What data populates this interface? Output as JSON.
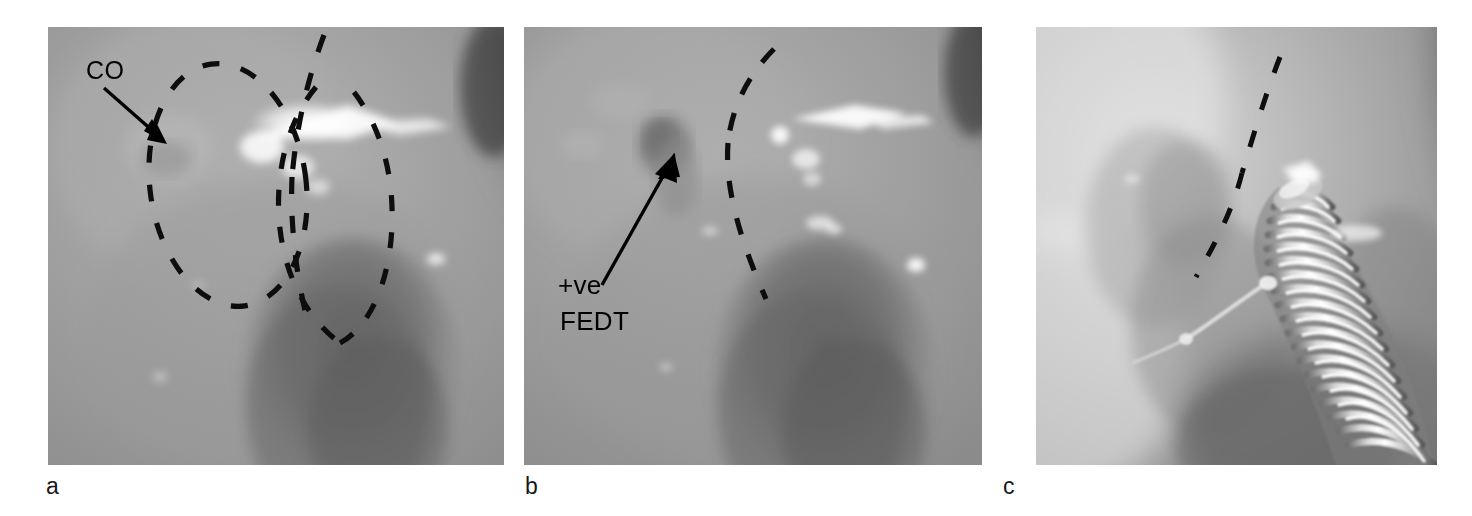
{
  "figure": {
    "kind": "endoscopic-photograph-triptych",
    "modality": "grayscale endoscopic / intraoperative photographs",
    "panel_count": 3,
    "background_color": "#ffffff",
    "ink_color": "#000000"
  },
  "panels": [
    {
      "id": "a",
      "label": "a",
      "label_x": 46,
      "label_y": 476,
      "x": 48,
      "y": 27,
      "width": 456,
      "height": 438,
      "base_color": "#9e9e9e",
      "description": "Endoscopic view of nasal / sinus mucosa with dashed outlines marking the olfactory cleft region and an arrow labelled CO pointing to the coronary / cribriform ostium",
      "annotations": [
        {
          "type": "text",
          "name": "co-label",
          "text": "CO",
          "x": 86,
          "y": 56,
          "font_size": 25
        },
        {
          "type": "arrow",
          "name": "co-arrow",
          "from_x": 104,
          "from_y": 88,
          "to_x": 163,
          "to_y": 140,
          "stroke_width": 3.2,
          "head_length": 22,
          "head_width": 15
        },
        {
          "type": "dashed-ellipse",
          "name": "lesion-outline-circle",
          "cx": 228,
          "cy": 185,
          "rx": 78,
          "ry": 122,
          "rotation": -8
        },
        {
          "type": "dashed-ellipse",
          "name": "lesion-outline-right",
          "cx": 316,
          "cy": 190,
          "rx": 62,
          "ry": 118,
          "rotation": 5
        },
        {
          "type": "dashed-curve",
          "name": "septal-line",
          "path": "M 322 32 C 300 80, 286 126, 282 170"
        }
      ],
      "highlights": [
        {
          "name": "specular-streak-main",
          "cx": 308,
          "cy": 122,
          "rx": 58,
          "ry": 19
        },
        {
          "name": "specular-streak-tail",
          "cx": 382,
          "cy": 124,
          "rx": 42,
          "ry": 8
        },
        {
          "name": "specular-dot-lower",
          "cx": 437,
          "cy": 262,
          "rx": 9,
          "ry": 5
        },
        {
          "name": "specular-dot-small",
          "cx": 160,
          "cy": 378,
          "rx": 7,
          "ry": 4
        }
      ],
      "shadows": [
        {
          "name": "turbinate-mass",
          "cx": 352,
          "cy": 372,
          "rx": 108,
          "ry": 135
        },
        {
          "name": "right-edge-shade",
          "cx": 500,
          "cy": 120,
          "rx": 48,
          "ry": 120
        }
      ]
    },
    {
      "id": "b",
      "label": "b",
      "label_x": 525,
      "label_y": 476,
      "x": 524,
      "y": 27,
      "width": 458,
      "height": 438,
      "base_color": "#9c9c9c",
      "description": "Same endoscopic field after fluorescein endoscopic dye test; arrow labelled +ve FEDT points to the positive dye-staining focus, with a single dashed line marking the boundary",
      "annotations": [
        {
          "type": "text",
          "name": "fedt-label-line1",
          "text": "+ve",
          "x": 558,
          "y": 272,
          "font_size": 26
        },
        {
          "type": "text",
          "name": "fedt-label-line2",
          "text": "FEDT",
          "x": 560,
          "y": 308,
          "font_size": 26
        },
        {
          "type": "arrow",
          "name": "fedt-arrow",
          "from_x": 608,
          "from_y": 281,
          "to_x": 672,
          "to_y": 160,
          "stroke_width": 3.2,
          "head_length": 24,
          "head_width": 16
        },
        {
          "type": "dashed-curve",
          "name": "boundary-line",
          "path": "M 756 47 C 724 78, 706 116, 704 156 C 702 212, 736 268, 754 300"
        }
      ],
      "highlights": [
        {
          "name": "specular-streak-main",
          "cx": 790,
          "cy": 110,
          "rx": 54,
          "ry": 10
        },
        {
          "name": "specular-dot-round",
          "cx": 760,
          "cy": 122,
          "rx": 8,
          "ry": 8
        },
        {
          "name": "specular-cluster",
          "cx": 780,
          "cy": 160,
          "rx": 16,
          "ry": 12
        },
        {
          "name": "specular-dot-right",
          "cx": 901,
          "cy": 262,
          "rx": 8,
          "ry": 6
        },
        {
          "name": "specular-dot-mid",
          "cx": 787,
          "cy": 212,
          "rx": 12,
          "ry": 7
        }
      ],
      "shadows": [
        {
          "name": "polyp-focus",
          "cx": 661,
          "cy": 140,
          "rx": 26,
          "ry": 28
        },
        {
          "name": "turbinate-mass",
          "cx": 830,
          "cy": 372,
          "rx": 108,
          "ry": 135
        },
        {
          "name": "right-edge-shade",
          "cx": 978,
          "cy": 110,
          "rx": 44,
          "ry": 110
        }
      ]
    },
    {
      "id": "c",
      "label": "c",
      "label_x": 1003,
      "label_y": 476,
      "x": 1036,
      "y": 27,
      "width": 401,
      "height": 438,
      "base_color": "#a5a5a5",
      "description": "Same field with a helical coiled instrument (spring-tipped probe / coil stent) introduced from the lower right toward the dashed boundary line",
      "annotations": [
        {
          "type": "dashed-curve",
          "name": "boundary-line",
          "path": "M 1277 63 C 1258 100, 1244 142, 1232 180 C 1220 218, 1204 250, 1192 272"
        }
      ],
      "instrument": {
        "name": "helical-coil-probe",
        "turn_count": 22,
        "tip_x": 1288,
        "tip_y": 196,
        "base_x": 1420,
        "base_y": 470,
        "wire_from_x": 1206,
        "wire_from_y": 305,
        "wire_to_x": 1280,
        "wire_to_y": 262
      },
      "highlights": [
        {
          "name": "specular-flare-tip",
          "cx": 1295,
          "cy": 184,
          "rx": 18,
          "ry": 9
        },
        {
          "name": "specular-streak-right",
          "cx": 1347,
          "cy": 238,
          "rx": 26,
          "ry": 7
        }
      ],
      "shadows": [
        {
          "name": "mucosal-shadow-left",
          "cx": 1150,
          "cy": 230,
          "rx": 60,
          "ry": 90
        },
        {
          "name": "right-edge-shade",
          "cx": 1432,
          "cy": 140,
          "rx": 40,
          "ry": 130
        },
        {
          "name": "lower-shade",
          "cx": 1290,
          "cy": 430,
          "rx": 130,
          "ry": 80
        }
      ]
    }
  ],
  "legend_terms": {
    "CO": "CO",
    "FEDT": "FEDT",
    "positive_marker": "+ve"
  }
}
